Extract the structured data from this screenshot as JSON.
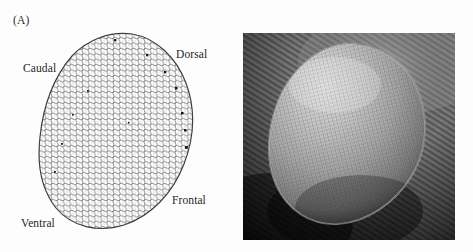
{
  "figure": {
    "background_color": "#fdfdfd",
    "panels": [
      {
        "id": "A",
        "label": "(A)",
        "kind": "line-drawing",
        "subject": "compound eye ommatidial lattice",
        "axis_labels": [
          {
            "name": "caudal",
            "text": "Caudal"
          },
          {
            "name": "dorsal",
            "text": "Dorsal"
          },
          {
            "name": "ventral",
            "text": "Ventral"
          },
          {
            "name": "frontal",
            "text": "Frontal"
          }
        ],
        "outline_color": "#3a3a3a",
        "facet_color": "#6e6e6e",
        "bristle_color": "#1a1a1a"
      },
      {
        "id": "B",
        "label": "(B)",
        "kind": "scanning-electron-micrograph",
        "subject": "compound eye surface",
        "tone_dark": "#141414",
        "tone_mid": "#6a6a6a",
        "tone_light": "#bcbcbc",
        "tone_highlight": "#d6d6d6"
      }
    ]
  }
}
